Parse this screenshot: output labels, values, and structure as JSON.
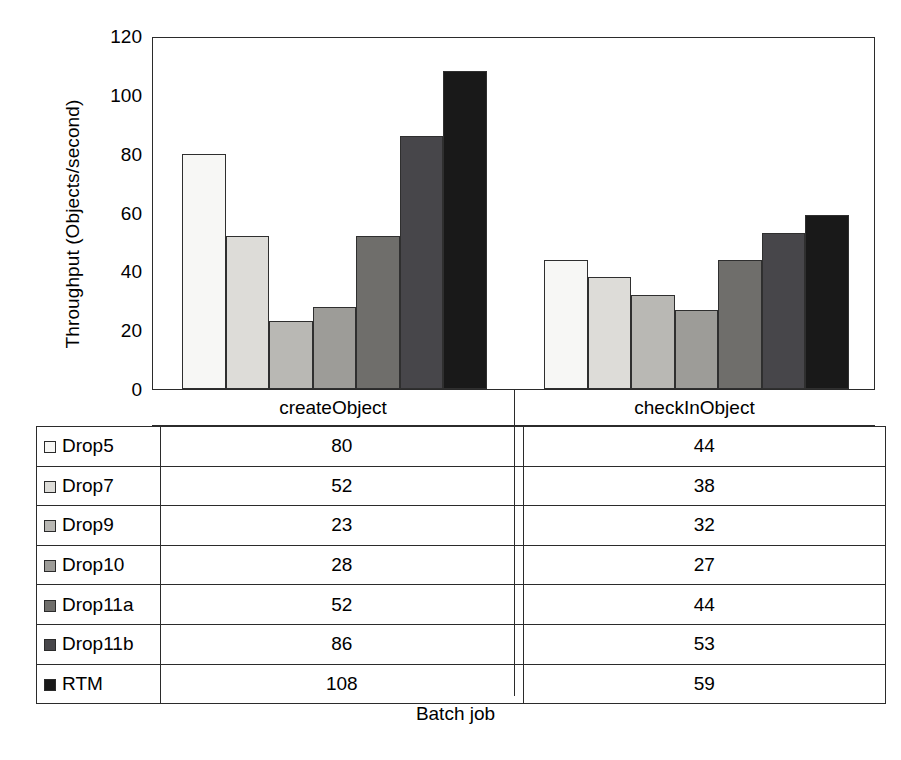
{
  "chart_data": {
    "type": "bar",
    "title": "",
    "xlabel": "Batch job",
    "ylabel": "Throughput (Objects/second)",
    "categories": [
      "createObject",
      "checkInObject"
    ],
    "ylim": [
      0,
      120
    ],
    "yticks": [
      0,
      20,
      40,
      60,
      80,
      100,
      120
    ],
    "ytick_labels": [
      "0",
      "20",
      "40",
      "60",
      "80",
      "100",
      "120"
    ],
    "grid": false,
    "legend_position": "table-below",
    "series": [
      {
        "name": "Drop5",
        "color": "#f7f7f5",
        "values": [
          80,
          44
        ]
      },
      {
        "name": "Drop7",
        "color": "#dddcd8",
        "values": [
          52,
          38
        ]
      },
      {
        "name": "Drop9",
        "color": "#b9b8b4",
        "values": [
          23,
          32
        ]
      },
      {
        "name": "Drop10",
        "color": "#9d9c98",
        "values": [
          28,
          27
        ]
      },
      {
        "name": "Drop11a",
        "color": "#6f6e6b",
        "values": [
          52,
          44
        ]
      },
      {
        "name": "Drop11b",
        "color": "#47464a",
        "values": [
          86,
          53
        ]
      },
      {
        "name": "RTM",
        "color": "#191919",
        "values": [
          108,
          59
        ]
      }
    ]
  },
  "table": {
    "row_header_label": "",
    "column_headers": [
      "createObject",
      "checkInObject"
    ],
    "rows": [
      {
        "label": "Drop5",
        "swatch": "#f7f7f5",
        "values": [
          "80",
          "44"
        ]
      },
      {
        "label": "Drop7",
        "swatch": "#dddcd8",
        "values": [
          "52",
          "38"
        ]
      },
      {
        "label": "Drop9",
        "swatch": "#b9b8b4",
        "values": [
          "23",
          "32"
        ]
      },
      {
        "label": "Drop10",
        "swatch": "#9d9c98",
        "values": [
          "28",
          "27"
        ]
      },
      {
        "label": "Drop11a",
        "swatch": "#6f6e6b",
        "values": [
          "52",
          "44"
        ]
      },
      {
        "label": "Drop11b",
        "swatch": "#47464a",
        "values": [
          "86",
          "53"
        ]
      },
      {
        "label": "RTM",
        "swatch": "#191919",
        "values": [
          "108",
          "59"
        ]
      }
    ]
  },
  "axes": {
    "y_title": "Throughput (Objects/second)",
    "x_title": "Batch job",
    "y_tick_labels": [
      "120",
      "100",
      "80",
      "60",
      "40",
      "20",
      "0"
    ]
  }
}
